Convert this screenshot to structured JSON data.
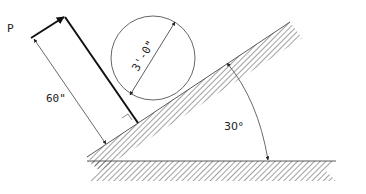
{
  "diagram": {
    "type": "statics-free-body",
    "labels": {
      "force": "P",
      "lever_length": "60\"",
      "diameter": "3'-0\"",
      "angle": "30°"
    },
    "colors": {
      "line": "#111111",
      "hatch": "#444444",
      "thin": "#555555"
    }
  }
}
